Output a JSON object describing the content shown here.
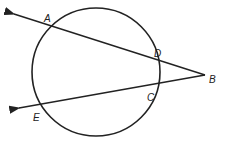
{
  "diagram": {
    "type": "circle with two secants from external point",
    "circle": {
      "cx": 96,
      "cy": 72,
      "r": 64
    },
    "points": {
      "A": {
        "label": "A",
        "x": 49,
        "y": 27
      },
      "B": {
        "label": "B",
        "x": 203,
        "y": 76
      },
      "C": {
        "label": "C",
        "x": 151,
        "y": 91
      },
      "D": {
        "label": "D",
        "x": 152,
        "y": 60
      },
      "E": {
        "label": "E",
        "x": 41,
        "y": 109
      }
    },
    "secants": [
      {
        "name": "BA",
        "from": "B",
        "through": [
          "D",
          "A"
        ]
      },
      {
        "name": "BE",
        "from": "B",
        "through": [
          "C",
          "E"
        ]
      }
    ],
    "labels": {
      "A": "A",
      "B": "B",
      "C": "C",
      "D": "D",
      "E": "E"
    },
    "stroke_color": "#222222"
  }
}
